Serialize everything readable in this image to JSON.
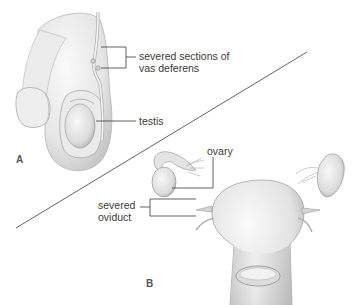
{
  "figure": {
    "panels": [
      {
        "id": "A",
        "letter": "A",
        "subject": "vasectomy",
        "labels": {
          "vas_line1": "severed sections of",
          "vas_line2": "vas deferens",
          "testis": "testis"
        }
      },
      {
        "id": "B",
        "letter": "B",
        "subject": "tubal ligation",
        "labels": {
          "ovary": "ovary",
          "oviduct_line1": "severed",
          "oviduct_line2": "oviduct"
        }
      }
    ],
    "colors": {
      "background": "#ffffff",
      "line": "#3a3a3a",
      "tissue_light": "#f2f2f2",
      "tissue_mid": "#d9d9d9",
      "tissue_dark": "#9a9a9a"
    }
  }
}
